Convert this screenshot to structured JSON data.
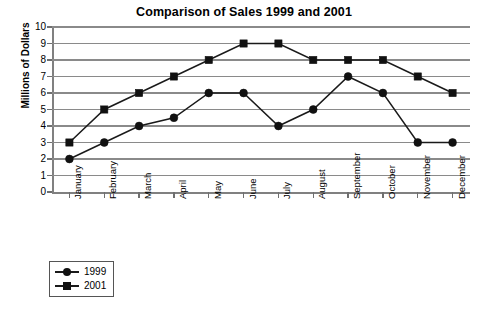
{
  "chart_data": {
    "type": "line",
    "title": "Comparison of Sales 1999 and 2001",
    "xlabel": "",
    "ylabel": "Millions of Dollars",
    "ylim": [
      0,
      10
    ],
    "ytick_labels": [
      "10",
      "9",
      "8",
      "7",
      "6",
      "5",
      "4",
      "3",
      "2",
      "1",
      "0"
    ],
    "yticks": [
      10,
      9,
      8,
      7,
      6,
      5,
      4,
      3,
      2,
      1,
      0
    ],
    "grid": true,
    "legend_position": "bottom-left",
    "categories": [
      "January",
      "February",
      "March",
      "April",
      "May",
      "June",
      "July",
      "August",
      "September",
      "October",
      "November",
      "December"
    ],
    "series": [
      {
        "name": "1999",
        "marker": "circle",
        "color": "#111111",
        "values": [
          2,
          3,
          4,
          4.5,
          6,
          6,
          4,
          5,
          7,
          6,
          3,
          3
        ]
      },
      {
        "name": "2001",
        "marker": "square",
        "color": "#111111",
        "values": [
          3,
          5,
          6,
          7,
          8,
          9,
          9,
          8,
          8,
          8,
          7,
          6
        ]
      }
    ]
  },
  "legend": {
    "entries": [
      {
        "label": "1999",
        "marker": "circle"
      },
      {
        "label": "2001",
        "marker": "square"
      }
    ]
  },
  "colors": {
    "grid": "#8a8a8a",
    "axis": "#808080",
    "series": "#111111",
    "background": "#ffffff"
  }
}
